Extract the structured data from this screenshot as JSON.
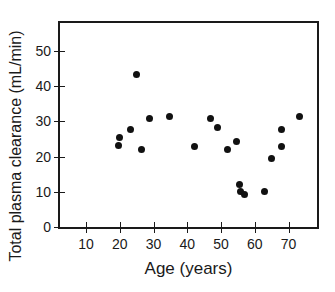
{
  "chart_data": {
    "type": "scatter",
    "title": "",
    "xlabel": "Age (years)",
    "ylabel": "Total plasma clearance (mL/min)",
    "xlim": [
      2.3,
      78.4
    ],
    "ylim": [
      0,
      58
    ],
    "xticks": [
      10,
      20,
      30,
      40,
      50,
      60,
      70
    ],
    "yticks": [
      0,
      10,
      20,
      30,
      40,
      50
    ],
    "xtick_labels": [
      "10",
      "20",
      "30",
      "40",
      "50",
      "60",
      "70"
    ],
    "ytick_labels": [
      "0",
      "10",
      "20",
      "30",
      "40",
      "50"
    ],
    "grid": false,
    "legend": "none",
    "marker": {
      "shape": "circle",
      "color": "#111111",
      "size_px": 7
    },
    "points": [
      {
        "x": 19.7,
        "y": 23.1
      },
      {
        "x": 19.9,
        "y": 25.4
      },
      {
        "x": 23.2,
        "y": 27.8
      },
      {
        "x": 25.1,
        "y": 43.5
      },
      {
        "x": 26.5,
        "y": 22.0
      },
      {
        "x": 28.8,
        "y": 30.8
      },
      {
        "x": 34.6,
        "y": 31.5
      },
      {
        "x": 42.0,
        "y": 23.0
      },
      {
        "x": 47.0,
        "y": 30.8
      },
      {
        "x": 49.0,
        "y": 28.2
      },
      {
        "x": 52.0,
        "y": 22.0
      },
      {
        "x": 54.7,
        "y": 24.2
      },
      {
        "x": 55.5,
        "y": 12.1
      },
      {
        "x": 55.8,
        "y": 10.1
      },
      {
        "x": 57.0,
        "y": 9.1
      },
      {
        "x": 63.0,
        "y": 10.2
      },
      {
        "x": 65.0,
        "y": 19.5
      },
      {
        "x": 67.8,
        "y": 27.7
      },
      {
        "x": 68.0,
        "y": 22.8
      },
      {
        "x": 73.2,
        "y": 31.5
      }
    ],
    "n_points": 20,
    "axis_color": "#1a1a1a",
    "background_color": "#ffffff"
  }
}
